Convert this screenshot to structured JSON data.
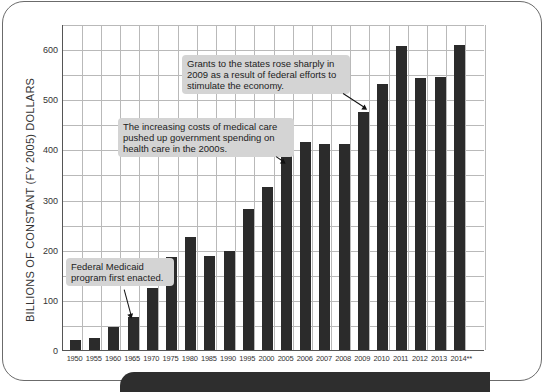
{
  "chart_data": {
    "type": "bar",
    "title": "",
    "xlabel": "",
    "ylabel": "BILLIONS OF CONSTANT (FY 2005) DOLLARS",
    "ylim": [
      0,
      650
    ],
    "yticks": [
      0,
      100,
      200,
      300,
      400,
      500,
      600
    ],
    "grid": true,
    "legend": null,
    "categories": [
      "1950",
      "1955",
      "1960",
      "1965",
      "1970",
      "1975",
      "1980",
      "1985",
      "1990",
      "1995",
      "2000",
      "2005",
      "2006",
      "2007",
      "2008",
      "2009",
      "2010",
      "2011",
      "2012",
      "2013",
      "2014**"
    ],
    "values": [
      20,
      24,
      45,
      66,
      123,
      186,
      226,
      188,
      197,
      282,
      325,
      427,
      415,
      411,
      410,
      475,
      530,
      606,
      543,
      545,
      608
    ],
    "bar_color": "#2b2b2b",
    "annotations": [
      {
        "text": "Federal Medicaid program first enacted.",
        "points_to": "1965"
      },
      {
        "text": "The increasing costs of medical care pushed up government spending on health care in the 2000s.",
        "points_to": "2005"
      },
      {
        "text": "Grants to the states rose sharply in 2009 as a result of federal efforts to stimulate the economy.",
        "points_to": "2009"
      }
    ]
  },
  "callouts": {
    "medicaid": [
      "Federal Medicaid",
      "program first enacted."
    ],
    "medical": [
      "The increasing costs of medical care",
      "pushed up government spending on",
      "health care in the 2000s."
    ],
    "grants": [
      "Grants to the states rose sharply in",
      "2009 as a result of federal efforts to",
      "stimulate the economy."
    ]
  }
}
